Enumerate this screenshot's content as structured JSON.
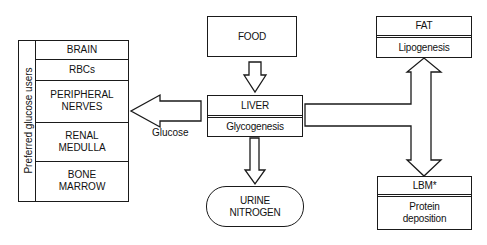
{
  "diagram": {
    "left_panel": {
      "title": "Preferred glucose users",
      "items": [
        {
          "label": "BRAIN"
        },
        {
          "label": "RBCs"
        },
        {
          "label": "PERIPHERAL NERVES"
        },
        {
          "label": "RENAL MEDULLA"
        },
        {
          "label": "BONE MARROW"
        }
      ]
    },
    "food": {
      "label": "FOOD"
    },
    "liver": {
      "title": "LIVER",
      "process": "Glycogenesis"
    },
    "glucose_arrow": {
      "label": "Glucose"
    },
    "urine": {
      "label": "URINE NITROGEN"
    },
    "fat": {
      "title": "FAT",
      "process": "Lipogenesis"
    },
    "lbm": {
      "title": "LBM*",
      "process": "Protein deposition"
    }
  }
}
